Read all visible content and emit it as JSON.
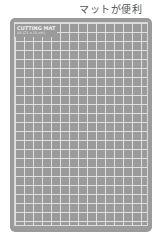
{
  "caption": "マットが便利",
  "mat": {
    "brand": "CUTTING MAT",
    "size": "A5 (21 x 15 cm)",
    "color": "#9b9b9b",
    "grid_color": "#ebebeb"
  }
}
